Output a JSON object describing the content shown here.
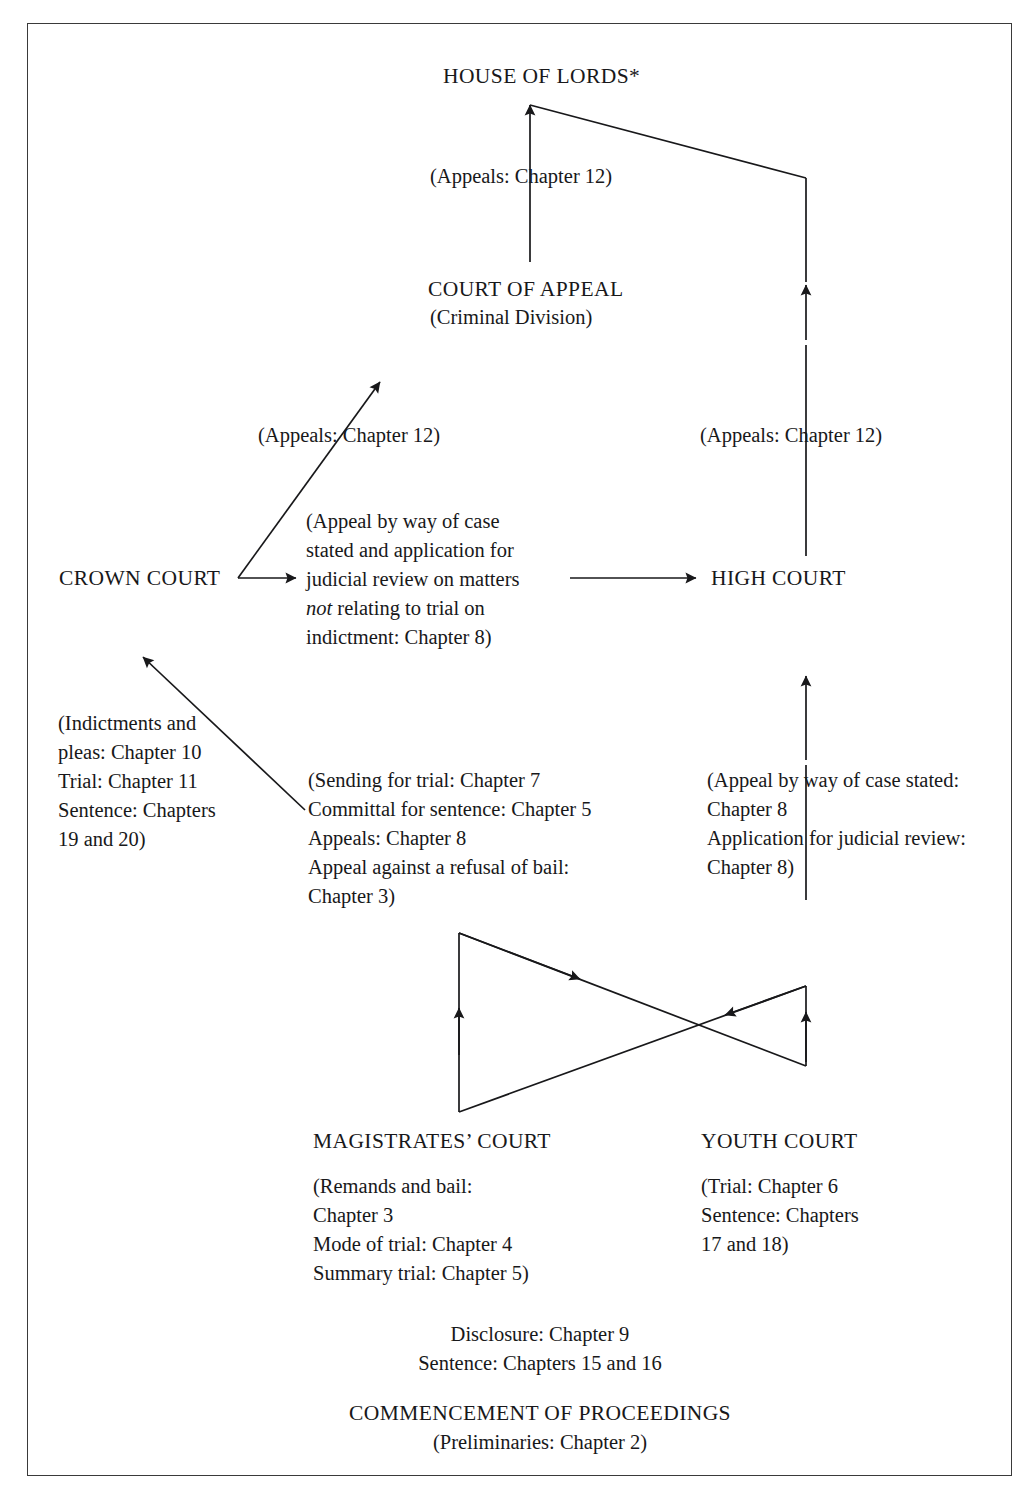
{
  "diagram": {
    "type": "flow-diagram",
    "background_color": "#ffffff",
    "line_color": "#18181a",
    "border_color": "#3a3a3a"
  },
  "nodes": {
    "house_of_lords": "HOUSE OF LORDS*",
    "house_of_lords_appeals": "(Appeals: Chapter 12)",
    "court_of_appeal": "COURT OF APPEAL",
    "court_of_appeal_division": "(Criminal Division)",
    "appeals_left": "(Appeals: Chapter 12)",
    "appeals_right": "(Appeals: Chapter 12)",
    "crown_court": "CROWN COURT",
    "crown_court_note_line1": "(Appeal by way of case",
    "crown_court_note_line2": "stated and application for",
    "crown_court_note_line3": "judicial review on matters",
    "crown_court_note_line4_italic": "not",
    "crown_court_note_line4_rest": " relating to trial on",
    "crown_court_note_line5": "indictment: Chapter 8)",
    "high_court": "HIGH COURT",
    "indictments_note": "(Indictments and\npleas: Chapter 10\nTrial: Chapter 11\nSentence: Chapters\n19 and 20)",
    "sending_note": "(Sending for trial: Chapter 7\nCommittal for sentence: Chapter 5\nAppeals: Chapter 8\nAppeal against a refusal of bail:\nChapter 3)",
    "high_court_note": "(Appeal by way of case stated:\nChapter 8\nApplication for judicial review:\nChapter 8)",
    "magistrates_court": "MAGISTRATES’ COURT",
    "magistrates_note": "(Remands and bail:\nChapter 3\nMode of trial: Chapter 4\nSummary  trial: Chapter 5)",
    "youth_court": "YOUTH COURT",
    "youth_note": "(Trial: Chapter 6\nSentence: Chapters\n17 and 18)",
    "disclosure_note": "Disclosure: Chapter 9\nSentence: Chapters 15 and 16",
    "commencement": "COMMENCEMENT OF PROCEEDINGS",
    "commencement_note": "(Preliminaries: Chapter 2)"
  },
  "edges": [
    {
      "name": "court-of-appeal-to-house-of-lords",
      "from": "COURT OF APPEAL",
      "to": "HOUSE OF LORDS*",
      "label": "(Appeals: Chapter 12)"
    },
    {
      "name": "high-court-to-house-of-lords",
      "from": "HIGH COURT",
      "to": "HOUSE OF LORDS*",
      "label": "(Appeals: Chapter 12)"
    },
    {
      "name": "crown-court-to-court-of-appeal",
      "from": "CROWN COURT",
      "to": "COURT OF APPEAL",
      "label": "(Appeals: Chapter 12)"
    },
    {
      "name": "crown-court-to-high-court",
      "from": "CROWN COURT",
      "to": "HIGH COURT",
      "label": "(Appeal by way of case stated and application for judicial review on matters not relating to trial on indictment: Chapter 8)"
    },
    {
      "name": "magistrates-court-to-crown-court",
      "from": "MAGISTRATES’ COURT",
      "to": "CROWN COURT",
      "label": "(Sending for trial: Chapter 7 / Committal for sentence: Chapter 5 / Appeals: Chapter 8 / Appeal against a refusal of bail: Chapter 3)"
    },
    {
      "name": "magistrates-court-to-high-court",
      "from": "MAGISTRATES’ COURT",
      "to": "HIGH COURT",
      "label": "(Appeal by way of case stated: Chapter 8 / Application for judicial review: Chapter 8)"
    },
    {
      "name": "commencement-to-magistrates-court",
      "from": "COMMENCEMENT OF PROCEEDINGS",
      "to": "MAGISTRATES’ COURT"
    },
    {
      "name": "commencement-to-youth-court",
      "from": "COMMENCEMENT OF PROCEEDINGS",
      "to": "YOUTH COURT"
    }
  ]
}
